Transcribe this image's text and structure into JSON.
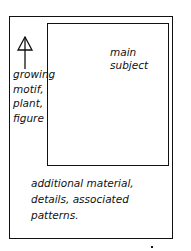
{
  "diagram": {
    "main_label": [
      "main",
      "subject"
    ],
    "side_label": [
      "growing",
      "motif,",
      "plant,",
      "figure"
    ],
    "bottom_label": [
      "additional material,",
      "details, associated",
      "patterns."
    ],
    "arrow": "up-arrow",
    "colors": {
      "line": "#111111",
      "background": "#ffffff"
    }
  }
}
